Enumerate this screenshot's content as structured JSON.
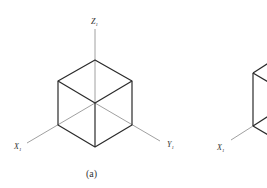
{
  "figure_a": {
    "caption": "(a)",
    "axes": {
      "z": {
        "letter": "Z",
        "sub": "1"
      },
      "x": {
        "letter": "X",
        "sub": "1"
      },
      "y": {
        "letter": "Y",
        "sub": "1"
      }
    }
  },
  "figure_b": {
    "axes": {
      "x": {
        "letter": "X",
        "sub": "1"
      }
    }
  },
  "colors": {
    "edge": "#2a2a2a",
    "axis": "#777777"
  }
}
